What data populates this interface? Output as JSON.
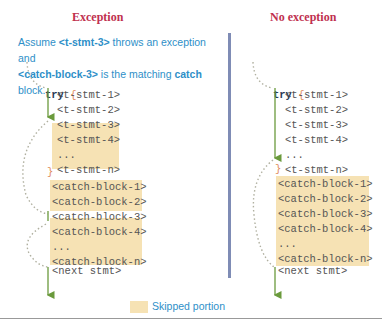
{
  "panels": {
    "exception": {
      "title": "Exception",
      "note": {
        "part1": "Assume ",
        "stmt": "<t-stmt-3>",
        "part2": " throws an exception and",
        "block": "<catch-block-3>",
        "part3": " is the matching ",
        "catch_word": "catch",
        "part4": " block."
      },
      "try_kw": "try",
      "open_brace": "{",
      "close_brace": "}",
      "lines": [
        "<t-stmt-1>",
        "<t-stmt-2>",
        "<t-stmt-3>",
        "<t-stmt-4>",
        "...",
        "<t-stmt-n>"
      ],
      "catch_lines": [
        "<catch-block-1>",
        "<catch-block-2>",
        "<catch-block-3>",
        "<catch-block-4>",
        "...",
        "<catch-block-n>"
      ],
      "next": "<next stmt>"
    },
    "no_exception": {
      "title": "No exception",
      "try_kw": "try",
      "open_brace": "{",
      "close_brace": "}",
      "lines": [
        "<t-stmt-1>",
        "<t-stmt-2>",
        "<t-stmt-3>",
        "<t-stmt-4>",
        "...",
        "<t-stmt-n>"
      ],
      "catch_lines": [
        "<catch-block-1>",
        "<catch-block-2>",
        "<catch-block-3>",
        "<catch-block-4>",
        "...",
        "<catch-block-n>"
      ],
      "next": "<next stmt>"
    }
  },
  "legend": {
    "label": "Skipped portion",
    "swatch_color": "#f6e2b4"
  },
  "colors": {
    "title": "#c0304f",
    "note": "#2e8fc8",
    "flow_arrow": "#6a9a3c",
    "divider": "#7f8cb5"
  }
}
